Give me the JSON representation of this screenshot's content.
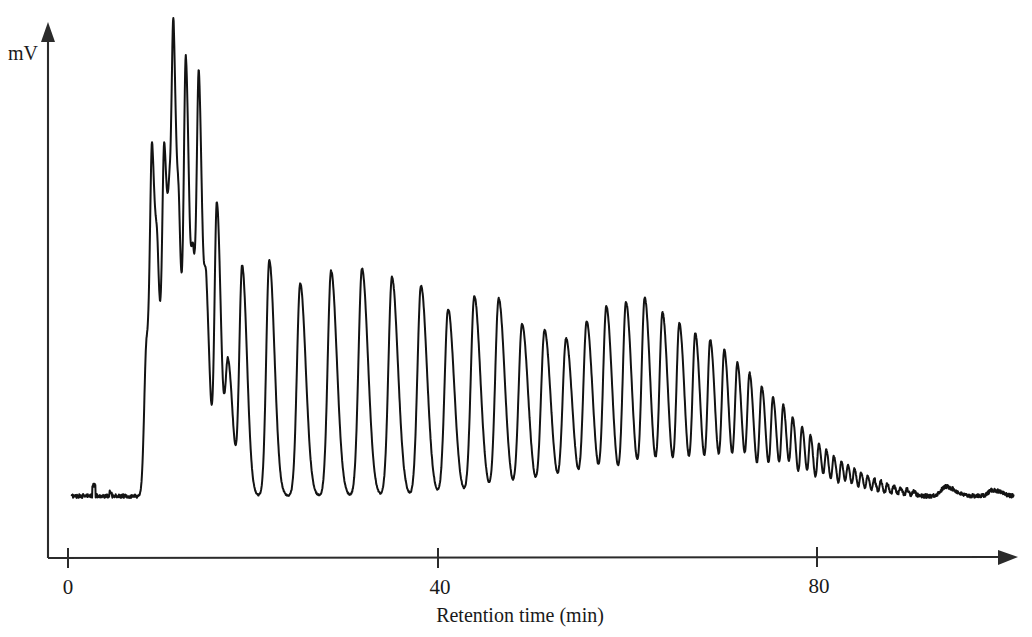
{
  "figure": {
    "title": "",
    "background_color": "#ffffff",
    "trace_color": "#131313",
    "axis_color": "#2b2b2b"
  },
  "axes": {
    "y_axis_title": "mV",
    "x_axis_title": "Retention time (min)",
    "x_ticks": [
      {
        "label": "0",
        "value": 0
      },
      {
        "label": "40",
        "value": 40
      },
      {
        "label": "80",
        "value": 80
      }
    ],
    "y_ticks": []
  },
  "chart_data": {
    "type": "line",
    "title": "",
    "subtitle": "",
    "xlabel": "Retention time (min)",
    "ylabel": "mV",
    "xlim": [
      0,
      101
    ],
    "ylim": [
      0,
      100
    ],
    "grid": false,
    "legend": "none",
    "annotations": [],
    "baseline_value": 4.0,
    "peaks": [
      {
        "x": 8.4,
        "height": 36.0,
        "width": 0.42
      },
      {
        "x": 9.0,
        "height": 68.5,
        "width": 0.36
      },
      {
        "x": 9.6,
        "height": 38.0,
        "width": 0.36
      },
      {
        "x": 10.3,
        "height": 76.0,
        "width": 0.38
      },
      {
        "x": 10.9,
        "height": 40.0,
        "width": 0.34
      },
      {
        "x": 11.3,
        "height": 86.5,
        "width": 0.36
      },
      {
        "x": 11.9,
        "height": 42.0,
        "width": 0.34
      },
      {
        "x": 12.6,
        "height": 97.5,
        "width": 0.38
      },
      {
        "x": 13.4,
        "height": 44.0,
        "width": 0.36
      },
      {
        "x": 14.0,
        "height": 87.5,
        "width": 0.38
      },
      {
        "x": 14.8,
        "height": 40.0,
        "width": 0.38
      },
      {
        "x": 15.9,
        "height": 68.5,
        "width": 0.42
      },
      {
        "x": 17.1,
        "height": 31.0,
        "width": 0.48
      },
      {
        "x": 18.6,
        "height": 54.0,
        "width": 0.5
      },
      {
        "x": 21.5,
        "height": 55.5,
        "width": 0.54
      },
      {
        "x": 24.8,
        "height": 50.0,
        "width": 0.58
      },
      {
        "x": 28.1,
        "height": 53.0,
        "width": 0.6
      },
      {
        "x": 31.4,
        "height": 53.5,
        "width": 0.62
      },
      {
        "x": 34.6,
        "height": 51.5,
        "width": 0.62
      },
      {
        "x": 37.7,
        "height": 49.5,
        "width": 0.62
      },
      {
        "x": 40.6,
        "height": 44.0,
        "width": 0.62
      },
      {
        "x": 43.4,
        "height": 47.0,
        "width": 0.62
      },
      {
        "x": 46.0,
        "height": 46.5,
        "width": 0.62
      },
      {
        "x": 48.5,
        "height": 40.5,
        "width": 0.62
      },
      {
        "x": 50.9,
        "height": 39.0,
        "width": 0.62
      },
      {
        "x": 53.2,
        "height": 37.0,
        "width": 0.62
      },
      {
        "x": 55.4,
        "height": 41.0,
        "width": 0.6
      },
      {
        "x": 57.5,
        "height": 44.5,
        "width": 0.58
      },
      {
        "x": 59.6,
        "height": 45.5,
        "width": 0.58
      },
      {
        "x": 61.6,
        "height": 46.5,
        "width": 0.56
      },
      {
        "x": 63.5,
        "height": 43.0,
        "width": 0.54
      },
      {
        "x": 65.3,
        "height": 40.5,
        "width": 0.52
      },
      {
        "x": 67.0,
        "height": 38.0,
        "width": 0.5
      },
      {
        "x": 68.6,
        "height": 36.5,
        "width": 0.48
      },
      {
        "x": 70.1,
        "height": 34.0,
        "width": 0.46
      },
      {
        "x": 71.5,
        "height": 31.0,
        "width": 0.44
      },
      {
        "x": 72.8,
        "height": 28.5,
        "width": 0.42
      },
      {
        "x": 74.1,
        "height": 25.5,
        "width": 0.4
      },
      {
        "x": 75.3,
        "height": 23.0,
        "width": 0.38
      },
      {
        "x": 76.4,
        "height": 21.0,
        "width": 0.36
      },
      {
        "x": 77.4,
        "height": 18.0,
        "width": 0.34
      },
      {
        "x": 78.4,
        "height": 16.0,
        "width": 0.32
      },
      {
        "x": 79.3,
        "height": 14.0,
        "width": 0.3
      },
      {
        "x": 80.2,
        "height": 12.0,
        "width": 0.3
      },
      {
        "x": 81.0,
        "height": 10.5,
        "width": 0.28
      },
      {
        "x": 81.8,
        "height": 9.2,
        "width": 0.28
      },
      {
        "x": 82.6,
        "height": 8.0,
        "width": 0.26
      },
      {
        "x": 83.3,
        "height": 7.0,
        "width": 0.26
      },
      {
        "x": 84.0,
        "height": 6.2,
        "width": 0.24
      },
      {
        "x": 84.7,
        "height": 5.4,
        "width": 0.24
      },
      {
        "x": 85.4,
        "height": 4.6,
        "width": 0.24
      },
      {
        "x": 86.1,
        "height": 4.0,
        "width": 0.22
      },
      {
        "x": 86.8,
        "height": 3.4,
        "width": 0.22
      },
      {
        "x": 87.5,
        "height": 2.8,
        "width": 0.22
      },
      {
        "x": 88.2,
        "height": 2.3,
        "width": 0.22
      },
      {
        "x": 88.9,
        "height": 1.9,
        "width": 0.22
      },
      {
        "x": 89.6,
        "height": 1.5,
        "width": 0.22
      },
      {
        "x": 90.3,
        "height": 1.2,
        "width": 0.22
      },
      {
        "x": 93.8,
        "height": 2.2,
        "width": 0.9
      },
      {
        "x": 98.8,
        "height": 1.4,
        "width": 0.8
      }
    ]
  }
}
